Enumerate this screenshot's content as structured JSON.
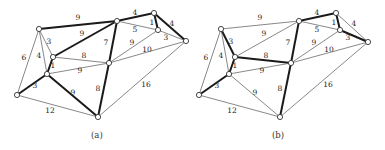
{
  "figures": [
    {
      "id": "a",
      "caption": "(a)",
      "offset_x": 0,
      "nodes": {
        "A": [
          39,
          29
        ],
        "C": [
          53,
          57
        ],
        "D": [
          47,
          74
        ],
        "E": [
          17,
          95
        ],
        "G": [
          98,
          117
        ],
        "F": [
          109,
          63
        ],
        "H": [
          117,
          21
        ],
        "I": [
          154,
          13
        ],
        "J": [
          158,
          30
        ],
        "K": [
          186,
          41
        ]
      },
      "edges": [
        {
          "u": "A",
          "v": "H",
          "w": "9",
          "thick": true,
          "lx": 78,
          "ly": 20
        },
        {
          "u": "A",
          "v": "E",
          "w": "6",
          "thick": false,
          "lx": 24,
          "ly": 60
        },
        {
          "u": "A",
          "v": "C",
          "w": "3",
          "thick": false,
          "lx": 49,
          "ly": 44
        },
        {
          "u": "A",
          "v": "D",
          "w": "4",
          "thick": false,
          "lx": 39,
          "ly": 58
        },
        {
          "u": "C",
          "v": "H",
          "w": "9",
          "thick": true,
          "lx": 82,
          "ly": 36
        },
        {
          "u": "C",
          "v": "F",
          "w": "8",
          "thick": false,
          "lx": 84,
          "ly": 58
        },
        {
          "u": "C",
          "v": "D",
          "w": "1",
          "thick": true,
          "lx": 53,
          "ly": 68
        },
        {
          "u": "D",
          "v": "F",
          "w": "9",
          "thick": false,
          "lx": 80,
          "ly": 73
        },
        {
          "u": "D",
          "v": "E",
          "w": "3",
          "thick": true,
          "lx": 35,
          "ly": 88
        },
        {
          "u": "D",
          "v": "G",
          "w": "9",
          "thick": true,
          "lx": 73,
          "ly": 95
        },
        {
          "u": "E",
          "v": "G",
          "w": "12",
          "thick": false,
          "lx": 50,
          "ly": 113
        },
        {
          "u": "F",
          "v": "G",
          "w": "8",
          "thick": true,
          "lx": 98,
          "ly": 91
        },
        {
          "u": "H",
          "v": "F",
          "w": "7",
          "thick": true,
          "lx": 106,
          "ly": 45
        },
        {
          "u": "F",
          "v": "J",
          "w": "9",
          "thick": false,
          "lx": 132,
          "ly": 45
        },
        {
          "u": "F",
          "v": "K",
          "w": "10",
          "thick": false,
          "lx": 147,
          "ly": 52
        },
        {
          "u": "G",
          "v": "K",
          "w": "16",
          "thick": false,
          "lx": 146,
          "ly": 87
        },
        {
          "u": "H",
          "v": "I",
          "w": "4",
          "thick": true,
          "lx": 135,
          "ly": 15
        },
        {
          "u": "H",
          "v": "J",
          "w": "5",
          "thick": false,
          "lx": 135,
          "ly": 32
        },
        {
          "u": "I",
          "v": "J",
          "w": "1",
          "thick": true,
          "lx": 152,
          "ly": 25
        },
        {
          "u": "I",
          "v": "K",
          "w": "4",
          "thick": true,
          "lx": 172,
          "ly": 26
        },
        {
          "u": "J",
          "v": "K",
          "w": "3",
          "thick": false,
          "lx": 166,
          "ly": 40
        }
      ]
    },
    {
      "id": "b",
      "caption": "(b)",
      "offset_x": 182,
      "nodes": {
        "A": [
          39,
          29
        ],
        "C": [
          53,
          57
        ],
        "D": [
          47,
          74
        ],
        "E": [
          17,
          95
        ],
        "G": [
          98,
          117
        ],
        "F": [
          109,
          63
        ],
        "H": [
          117,
          21
        ],
        "I": [
          154,
          13
        ],
        "J": [
          158,
          30
        ],
        "K": [
          186,
          42
        ]
      },
      "edges": [
        {
          "u": "A",
          "v": "H",
          "w": "9",
          "thick": false,
          "lx": 78,
          "ly": 20
        },
        {
          "u": "A",
          "v": "E",
          "w": "6",
          "thick": false,
          "lx": 24,
          "ly": 60
        },
        {
          "u": "A",
          "v": "C",
          "w": "3",
          "thick": true,
          "lx": 49,
          "ly": 44
        },
        {
          "u": "A",
          "v": "D",
          "w": "4",
          "thick": false,
          "lx": 39,
          "ly": 58
        },
        {
          "u": "C",
          "v": "H",
          "w": "9",
          "thick": false,
          "lx": 82,
          "ly": 36
        },
        {
          "u": "C",
          "v": "F",
          "w": "8",
          "thick": true,
          "lx": 84,
          "ly": 58
        },
        {
          "u": "C",
          "v": "D",
          "w": "1",
          "thick": true,
          "lx": 53,
          "ly": 68
        },
        {
          "u": "D",
          "v": "F",
          "w": "9",
          "thick": false,
          "lx": 80,
          "ly": 73
        },
        {
          "u": "D",
          "v": "E",
          "w": "3",
          "thick": true,
          "lx": 35,
          "ly": 88
        },
        {
          "u": "D",
          "v": "G",
          "w": "9",
          "thick": false,
          "lx": 73,
          "ly": 95
        },
        {
          "u": "E",
          "v": "G",
          "w": "12",
          "thick": false,
          "lx": 50,
          "ly": 113
        },
        {
          "u": "F",
          "v": "G",
          "w": "8",
          "thick": true,
          "lx": 98,
          "ly": 91
        },
        {
          "u": "H",
          "v": "F",
          "w": "7",
          "thick": true,
          "lx": 106,
          "ly": 45
        },
        {
          "u": "F",
          "v": "J",
          "w": "9",
          "thick": false,
          "lx": 132,
          "ly": 45
        },
        {
          "u": "F",
          "v": "K",
          "w": "10",
          "thick": false,
          "lx": 147,
          "ly": 52
        },
        {
          "u": "G",
          "v": "K",
          "w": "16",
          "thick": false,
          "lx": 146,
          "ly": 87
        },
        {
          "u": "H",
          "v": "I",
          "w": "4",
          "thick": true,
          "lx": 135,
          "ly": 15
        },
        {
          "u": "H",
          "v": "J",
          "w": "5",
          "thick": false,
          "lx": 135,
          "ly": 32
        },
        {
          "u": "I",
          "v": "J",
          "w": "1",
          "thick": true,
          "lx": 152,
          "ly": 25
        },
        {
          "u": "I",
          "v": "K",
          "w": "4",
          "thick": false,
          "lx": 172,
          "ly": 26
        },
        {
          "u": "J",
          "v": "K",
          "w": "3",
          "thick": true,
          "lx": 166,
          "ly": 40
        }
      ]
    }
  ]
}
